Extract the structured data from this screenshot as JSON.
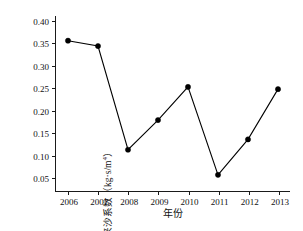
{
  "chart_data": {
    "type": "line",
    "title": "",
    "xlabel": "年份",
    "ylabel": "来沙系数（kg·s/m",
    "ylabel_superscript": "4",
    "ylabel_suffix": "）",
    "categories": [
      "2006",
      "2007",
      "2008",
      "2009",
      "2010",
      "2011",
      "2012",
      "2013"
    ],
    "values": [
      0.355,
      0.343,
      0.112,
      0.178,
      0.252,
      0.056,
      0.135,
      0.247
    ],
    "xtick_labels": [
      "2006",
      "2007",
      "2008",
      "2009",
      "2010",
      "2011",
      "2012",
      "2013"
    ],
    "ytick_labels": [
      "0.05",
      "0.10",
      "0.15",
      "0.20",
      "0.25",
      "0.30",
      "0.35",
      "0.40"
    ],
    "ytick_values": [
      0.05,
      0.1,
      0.15,
      0.2,
      0.25,
      0.3,
      0.35,
      0.4
    ],
    "ylim": [
      0.02,
      0.41
    ],
    "xlim": [
      2005.6,
      2013.4
    ],
    "grid": false,
    "legend": false,
    "legend_position": "none",
    "marker": "filled-circle",
    "line_color": "#000000",
    "marker_color": "#000000",
    "background_color": "#ffffff",
    "axis_color": "#1a1a1a"
  }
}
